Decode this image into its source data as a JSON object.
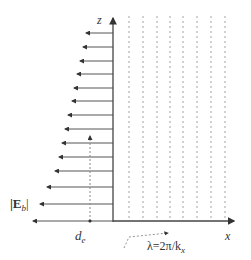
{
  "diagram": {
    "axes": {
      "z_label": "z",
      "x_label": "x"
    },
    "labels": {
      "field_magnitude": "|E",
      "field_subscript": "b",
      "field_close": "|",
      "depth_label": "d",
      "depth_subscript": "e",
      "wavelength_label": "λ=2π/k",
      "wavelength_subscript": "x"
    },
    "arrows": [
      {
        "y": 33,
        "tip_x": 86
      },
      {
        "y": 47,
        "tip_x": 83
      },
      {
        "y": 61,
        "tip_x": 80
      },
      {
        "y": 74,
        "tip_x": 77
      },
      {
        "y": 88,
        "tip_x": 74
      },
      {
        "y": 101,
        "tip_x": 72
      },
      {
        "y": 115,
        "tip_x": 68
      },
      {
        "y": 129,
        "tip_x": 65
      },
      {
        "y": 143,
        "tip_x": 62
      },
      {
        "y": 157,
        "tip_x": 59
      },
      {
        "y": 171,
        "tip_x": 55
      },
      {
        "y": 187,
        "tip_x": 47
      },
      {
        "y": 204,
        "tip_x": 40
      },
      {
        "y": 221,
        "tip_x": 33
      }
    ],
    "wavefront_lines_x": [
      129,
      143,
      157,
      170,
      183,
      197,
      211,
      225
    ],
    "colors": {
      "axis": "#444444",
      "arrow": "#555555",
      "dashed": "#999999"
    }
  }
}
